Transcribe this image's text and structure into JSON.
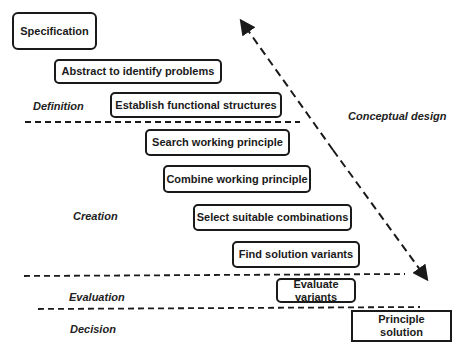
{
  "diagram": {
    "steps": [
      {
        "id": "specification",
        "label": "Specification"
      },
      {
        "id": "abstract",
        "label": "Abstract to identify problems"
      },
      {
        "id": "establish",
        "label": "Establish functional structures"
      },
      {
        "id": "search",
        "label": "Search working principle"
      },
      {
        "id": "combine",
        "label": "Combine working principle"
      },
      {
        "id": "select",
        "label": "Select suitable combinations"
      },
      {
        "id": "find",
        "label": "Find solution variants"
      },
      {
        "id": "evaluate",
        "label": "Evaluate variants"
      },
      {
        "id": "principle",
        "label": "Principle solution"
      }
    ],
    "phases": [
      {
        "id": "definition",
        "label": "Definition"
      },
      {
        "id": "creation",
        "label": "Creation"
      },
      {
        "id": "evaluation",
        "label": "Evaluation"
      },
      {
        "id": "decision",
        "label": "Decision"
      }
    ],
    "arrow_label": "Conceptual design",
    "colors": {
      "stroke": "#1a1a1a",
      "background": "#ffffff"
    }
  }
}
